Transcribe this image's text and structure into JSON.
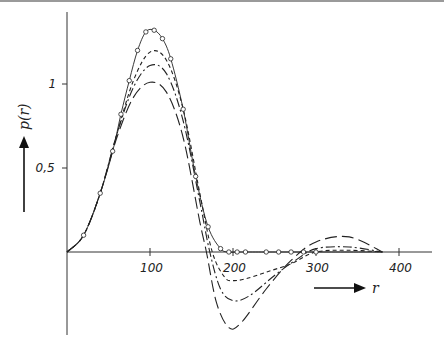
{
  "chart_data": {
    "type": "line",
    "title": "",
    "xlabel": "r",
    "ylabel": "p(r)",
    "xlim": [
      0,
      450
    ],
    "ylim": [
      -0.6,
      1.4
    ],
    "x_ticks": [
      100,
      200,
      300,
      400
    ],
    "x_tick_labels": [
      "100",
      "200",
      "300",
      "400"
    ],
    "y_ticks": [
      0.5,
      1
    ],
    "y_tick_labels": [
      "0,5",
      "1"
    ],
    "grid": false,
    "legend": null,
    "series": [
      {
        "name": "solid with circles",
        "style": "solid",
        "markers": "circle",
        "x": [
          0,
          20,
          40,
          55,
          65,
          75,
          85,
          95,
          105,
          115,
          125,
          140,
          155,
          170,
          185,
          195,
          205,
          215,
          240,
          255,
          270,
          285,
          300,
          340,
          380
        ],
        "y": [
          0,
          0.1,
          0.35,
          0.6,
          0.82,
          1.02,
          1.2,
          1.31,
          1.32,
          1.27,
          1.15,
          0.85,
          0.45,
          0.15,
          0.02,
          0,
          0,
          0,
          0,
          0,
          0,
          0,
          0,
          0,
          0
        ]
      },
      {
        "name": "short dash",
        "style": "dash-short",
        "x": [
          0,
          20,
          40,
          60,
          80,
          100,
          120,
          140,
          160,
          175,
          190,
          200,
          215,
          240,
          270,
          300,
          340,
          380
        ],
        "y": [
          0,
          0.1,
          0.35,
          0.7,
          1.02,
          1.19,
          1.14,
          0.85,
          0.35,
          0.0,
          -0.15,
          -0.17,
          -0.16,
          -0.12,
          -0.07,
          0.0,
          0.01,
          0.0
        ]
      },
      {
        "name": "dash-dot",
        "style": "dash-dot",
        "x": [
          0,
          20,
          40,
          60,
          80,
          100,
          120,
          140,
          160,
          172,
          185,
          200,
          220,
          250,
          275,
          300,
          340,
          380
        ],
        "y": [
          0,
          0.1,
          0.35,
          0.7,
          0.98,
          1.11,
          1.06,
          0.78,
          0.3,
          0.0,
          -0.22,
          -0.29,
          -0.26,
          -0.14,
          -0.05,
          0.02,
          0.03,
          0.0
        ]
      },
      {
        "name": "long dash",
        "style": "dash-long",
        "x": [
          0,
          20,
          40,
          60,
          80,
          100,
          120,
          140,
          160,
          168,
          180,
          195,
          210,
          240,
          270,
          300,
          340,
          380
        ],
        "y": [
          0,
          0.1,
          0.35,
          0.68,
          0.92,
          1.01,
          0.95,
          0.68,
          0.18,
          0.0,
          -0.3,
          -0.45,
          -0.42,
          -0.22,
          -0.05,
          0.06,
          0.09,
          0.0
        ]
      }
    ]
  },
  "axes": {
    "x_label": "r",
    "y_label": "p(r)",
    "x_tick_labels": [
      "100",
      "200",
      "300",
      "400"
    ],
    "y_tick_labels": [
      "1",
      "0,5"
    ]
  }
}
